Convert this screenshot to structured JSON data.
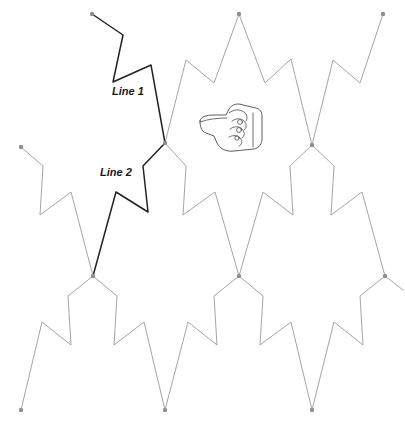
{
  "figure": {
    "background_color": "#ffffff",
    "faint_stroke_color": "#9a9a9a",
    "bold_stroke_color": "#222222",
    "node_color": "#8f8f8f",
    "width": 405,
    "height": 423
  },
  "labels": {
    "line1": "Line 1",
    "line2": "Line 2"
  },
  "cursor": {
    "icon_name": "pointing-hand-cursor",
    "direction": "left",
    "x": 196,
    "y": 103
  },
  "chart_data": {
    "type": "line",
    "xlabel": "",
    "ylabel": "",
    "xlim": [
      0,
      405
    ],
    "ylim": [
      0,
      423
    ],
    "grid": false,
    "legend": "none",
    "annotations": [
      {
        "text": "Line 1",
        "x": 112,
        "y": 95
      },
      {
        "text": "Line 2",
        "x": 100,
        "y": 176
      }
    ],
    "series": [
      {
        "name": "Line 1",
        "emphasis": "bold",
        "color": "#222222",
        "points": [
          [
            92,
            14
          ],
          [
            123,
            35
          ],
          [
            113,
            82
          ],
          [
            151,
            65
          ],
          [
            165,
            143
          ]
        ]
      },
      {
        "name": "Line 2",
        "emphasis": "bold",
        "color": "#222222",
        "points": [
          [
            165,
            143
          ],
          [
            143,
            166
          ],
          [
            148,
            212
          ],
          [
            116,
            192
          ],
          [
            93,
            276
          ]
        ]
      },
      {
        "name": "tile-upper-center",
        "emphasis": "faint",
        "color": "#9a9a9a",
        "points": [
          [
            165,
            143
          ],
          [
            186,
            166
          ],
          [
            183,
            215
          ],
          [
            215,
            192
          ],
          [
            239,
            276
          ]
        ]
      },
      {
        "name": "tile-upper-center-crown",
        "emphasis": "faint",
        "color": "#9a9a9a",
        "points": [
          [
            165,
            143
          ],
          [
            186,
            60
          ],
          [
            214,
            83
          ],
          [
            239,
            14
          ],
          [
            265,
            83
          ],
          [
            291,
            59
          ],
          [
            312,
            145
          ]
        ]
      },
      {
        "name": "tile-upper-right-crown",
        "emphasis": "faint",
        "color": "#9a9a9a",
        "points": [
          [
            312,
            145
          ],
          [
            333,
            60
          ],
          [
            360,
            83
          ],
          [
            383,
            14
          ]
        ]
      },
      {
        "name": "tile-right-upper-body",
        "emphasis": "faint",
        "color": "#9a9a9a",
        "points": [
          [
            312,
            145
          ],
          [
            290,
            166
          ],
          [
            293,
            215
          ],
          [
            263,
            192
          ],
          [
            239,
            276
          ]
        ]
      },
      {
        "name": "tile-right-body",
        "emphasis": "faint",
        "color": "#9a9a9a",
        "points": [
          [
            312,
            145
          ],
          [
            334,
            166
          ],
          [
            331,
            215
          ],
          [
            362,
            192
          ],
          [
            385,
            276
          ]
        ]
      },
      {
        "name": "tile-left-arm",
        "emphasis": "faint",
        "color": "#9a9a9a",
        "points": [
          [
            21,
            147
          ],
          [
            43,
            166
          ],
          [
            40,
            215
          ],
          [
            71,
            192
          ],
          [
            93,
            276
          ]
        ]
      },
      {
        "name": "tile-lower-left-crown",
        "emphasis": "faint",
        "color": "#9a9a9a",
        "points": [
          [
            93,
            276
          ],
          [
            68,
            296
          ],
          [
            71,
            345
          ],
          [
            42,
            322
          ],
          [
            21,
            410
          ]
        ]
      },
      {
        "name": "tile-lower-left-right",
        "emphasis": "faint",
        "color": "#9a9a9a",
        "points": [
          [
            93,
            276
          ],
          [
            117,
            296
          ],
          [
            114,
            345
          ],
          [
            144,
            322
          ],
          [
            165,
            410
          ]
        ]
      },
      {
        "name": "tile-lower-center-left",
        "emphasis": "faint",
        "color": "#9a9a9a",
        "points": [
          [
            239,
            276
          ],
          [
            214,
            296
          ],
          [
            217,
            345
          ],
          [
            188,
            322
          ],
          [
            165,
            410
          ]
        ]
      },
      {
        "name": "tile-lower-center-right",
        "emphasis": "faint",
        "color": "#9a9a9a",
        "points": [
          [
            239,
            276
          ],
          [
            263,
            296
          ],
          [
            260,
            345
          ],
          [
            291,
            322
          ],
          [
            312,
            410
          ]
        ]
      },
      {
        "name": "tile-lower-right-left",
        "emphasis": "faint",
        "color": "#9a9a9a",
        "points": [
          [
            385,
            276
          ],
          [
            360,
            296
          ],
          [
            363,
            345
          ],
          [
            334,
            322
          ],
          [
            312,
            410
          ]
        ]
      },
      {
        "name": "tile-lower-right-edge",
        "emphasis": "faint",
        "color": "#9a9a9a",
        "points": [
          [
            385,
            276
          ],
          [
            403,
            290
          ]
        ]
      }
    ],
    "nodes": [
      {
        "name": "node-top-left",
        "x": 92,
        "y": 14
      },
      {
        "name": "node-top-center",
        "x": 239,
        "y": 14
      },
      {
        "name": "node-top-right",
        "x": 383,
        "y": 14
      },
      {
        "name": "node-junction-center",
        "x": 165,
        "y": 143
      },
      {
        "name": "node-junction-right",
        "x": 312,
        "y": 145
      },
      {
        "name": "node-left-arm-end",
        "x": 21,
        "y": 147
      },
      {
        "name": "node-junction-lower-left",
        "x": 93,
        "y": 276
      },
      {
        "name": "node-junction-lower-center",
        "x": 239,
        "y": 276
      },
      {
        "name": "node-junction-lower-right",
        "x": 385,
        "y": 276
      },
      {
        "name": "node-bottom-left",
        "x": 21,
        "y": 410
      },
      {
        "name": "node-bottom-center",
        "x": 165,
        "y": 410
      },
      {
        "name": "node-bottom-right",
        "x": 312,
        "y": 410
      }
    ]
  }
}
